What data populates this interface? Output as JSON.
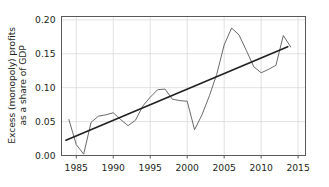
{
  "chart_data": {
    "type": "line",
    "title": "",
    "xlabel": "",
    "ylabel_line1": "Excess (monopoly) profits",
    "ylabel_line2": "as a share of GDP",
    "xlim": [
      1983,
      2016
    ],
    "ylim": [
      0.0,
      0.205
    ],
    "xticks": [
      1985,
      1990,
      1995,
      2000,
      2005,
      2010,
      2015
    ],
    "xtick_labels": [
      "1985",
      "1990",
      "1995",
      "2000",
      "2005",
      "2010",
      "2015"
    ],
    "yticks": [
      0.0,
      0.05,
      0.1,
      0.15,
      0.2
    ],
    "ytick_labels": [
      "0.00",
      "0.05",
      "0.10",
      "0.15",
      "0.20"
    ],
    "grid": true,
    "legend": "none",
    "series": [
      {
        "name": "Excess (monopoly) profits as a share of GDP",
        "kind": "data-line",
        "color": "#595959",
        "width": 0.9,
        "x": [
          1984,
          1985,
          1986,
          1987,
          1988,
          1989,
          1990,
          1991,
          1992,
          1993,
          1994,
          1995,
          1996,
          1997,
          1998,
          1999,
          2000,
          2001,
          2002,
          2003,
          2004,
          2005,
          2006,
          2007,
          2008,
          2009,
          2010,
          2011,
          2012,
          2013,
          2014
        ],
        "values": [
          0.053,
          0.016,
          0.002,
          0.049,
          0.058,
          0.06,
          0.063,
          0.053,
          0.044,
          0.052,
          0.073,
          0.086,
          0.097,
          0.098,
          0.083,
          0.081,
          0.08,
          0.038,
          0.06,
          0.088,
          0.12,
          0.163,
          0.188,
          0.178,
          0.155,
          0.131,
          0.122,
          0.127,
          0.133,
          0.177,
          0.16
        ]
      },
      {
        "name": "Linear trend",
        "kind": "trend-line",
        "color": "#231f20",
        "width": 1.6,
        "x": [
          1983.6,
          2013.6
        ],
        "values": [
          0.0225,
          0.1605
        ]
      }
    ]
  },
  "style": {
    "axis_color": "#595959",
    "grid_color": "#d9d9d9",
    "background": "#ffffff",
    "text_color": "#231f20"
  }
}
